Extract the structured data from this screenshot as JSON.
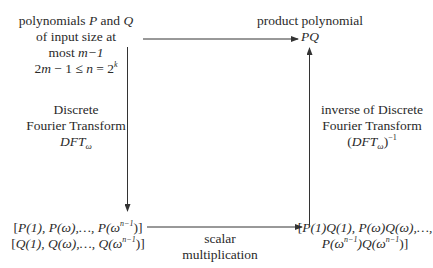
{
  "diagram": {
    "type": "commutative-flow-diagram",
    "nodes": {
      "input": {
        "line1_text": "polynomials",
        "line1_var1": "P",
        "line1_and": "and",
        "line1_var2": "Q",
        "line2": "of input size at",
        "line3_text": "most",
        "line3_math": "m−1",
        "line4_a": "2",
        "line4_m": "m",
        "line4_b": " − 1 ≤ ",
        "line4_n": "n",
        "line4_c": " = 2",
        "line4_exp": "k"
      },
      "output": {
        "line1": "product polynomial",
        "line2": "PQ"
      },
      "evaluations": {
        "row1_open": "[",
        "row1_body": "P(1), P(ω),…, P(ω",
        "row1_exp": "n−1",
        "row1_close": ")]",
        "row2_open": "[",
        "row2_body": "Q(1), Q(ω),…, Q(ω",
        "row2_exp": "n−1",
        "row2_close": ")]"
      },
      "products": {
        "row1_open": "[",
        "row1_body": "P(1)Q(1), P(ω)Q(ω),…,",
        "row2_a": "P(ω",
        "row2_exp1": "n−1",
        "row2_b": ")Q(ω",
        "row2_exp2": "n−1",
        "row2_c": ")]"
      }
    },
    "edges": {
      "dft": {
        "line1": "Discrete",
        "line2": "Fourier Transform",
        "symbol": "DFT",
        "subscript": "ω"
      },
      "inverse_dft": {
        "line1": "inverse of Discrete",
        "line2": "Fourier Transform",
        "open": "(",
        "symbol": "DFT",
        "subscript": "ω",
        "close": ")",
        "exponent": "−1"
      },
      "scalar": {
        "line1": "scalar",
        "line2": "multiplication"
      }
    },
    "colors": {
      "text": "#2a2a2a",
      "arrow": "#333333",
      "background": "#ffffff"
    }
  }
}
